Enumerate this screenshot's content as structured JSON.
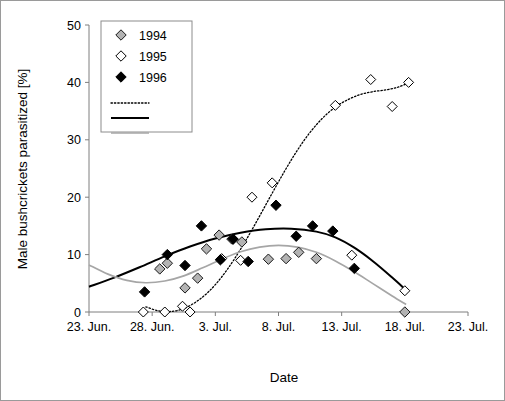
{
  "figure": {
    "frame_border_color": "#9a9a9a",
    "background": "#ffffff"
  },
  "axis": {
    "x_title": "Date",
    "y_title": "Male bushcrickets parasitized [%]"
  },
  "legend": {
    "entries": [
      {
        "label": "1994",
        "marker": "diamond-gray-filled",
        "color": "#b3b3b3"
      },
      {
        "label": "1995",
        "marker": "diamond-open-white",
        "color": "#ffffff"
      },
      {
        "label": "1996",
        "marker": "diamond-black-filled",
        "color": "#000000"
      }
    ],
    "lines": [
      {
        "name": "dotted-trend-line",
        "style": "dotted",
        "color": "#000000"
      },
      {
        "name": "solid-trend-line",
        "style": "solid",
        "color": "#000000"
      },
      {
        "name": "gray-trend-line",
        "style": "solid",
        "color": "#a6a6a6"
      }
    ]
  },
  "chart_data": {
    "type": "scatter",
    "title": "",
    "xlabel": "Date",
    "ylabel": "Male bushcrickets parasitized [%]",
    "ylim": [
      0,
      50
    ],
    "yticks": [
      0,
      10,
      20,
      30,
      40,
      50
    ],
    "xlim_days": [
      0,
      30
    ],
    "xticks_days": [
      0,
      5,
      10,
      15,
      20,
      25,
      30
    ],
    "xtick_labels": [
      "23. Jun.",
      "28. Jun.",
      "3. Jul.",
      "8. Jul.",
      "13. Jul.",
      "18. Jul.",
      "23. Jul."
    ],
    "grid": false,
    "legend_position": "top-left",
    "series": [
      {
        "name": "1994",
        "marker": "diamond-gray-filled",
        "color": "#b3b3b3",
        "points": [
          {
            "x": 5.6,
            "y": 7.5
          },
          {
            "x": 6.2,
            "y": 8.5
          },
          {
            "x": 7.6,
            "y": 4.2
          },
          {
            "x": 8.6,
            "y": 5.9
          },
          {
            "x": 9.3,
            "y": 11.0
          },
          {
            "x": 10.3,
            "y": 13.4
          },
          {
            "x": 11.4,
            "y": 12.7
          },
          {
            "x": 12.1,
            "y": 12.2
          },
          {
            "x": 14.2,
            "y": 9.2
          },
          {
            "x": 15.6,
            "y": 9.3
          },
          {
            "x": 16.6,
            "y": 10.4
          },
          {
            "x": 18.0,
            "y": 9.3
          },
          {
            "x": 25.0,
            "y": 0.0
          }
        ]
      },
      {
        "name": "1995",
        "marker": "diamond-open-white",
        "color": "#ffffff",
        "points": [
          {
            "x": 4.3,
            "y": 0.0
          },
          {
            "x": 6.0,
            "y": 0.0
          },
          {
            "x": 7.4,
            "y": 1.0
          },
          {
            "x": 8.0,
            "y": 0.0
          },
          {
            "x": 10.5,
            "y": 9.3
          },
          {
            "x": 11.3,
            "y": 12.7
          },
          {
            "x": 12.0,
            "y": 9.0
          },
          {
            "x": 12.9,
            "y": 20.0
          },
          {
            "x": 14.5,
            "y": 22.5
          },
          {
            "x": 19.5,
            "y": 36.0
          },
          {
            "x": 20.8,
            "y": 9.9
          },
          {
            "x": 22.3,
            "y": 40.5
          },
          {
            "x": 24.0,
            "y": 35.8
          },
          {
            "x": 25.3,
            "y": 40.0
          },
          {
            "x": 25.0,
            "y": 3.7
          }
        ]
      },
      {
        "name": "1996",
        "marker": "diamond-black-filled",
        "color": "#000000",
        "points": [
          {
            "x": 4.4,
            "y": 3.5
          },
          {
            "x": 6.2,
            "y": 10.0
          },
          {
            "x": 7.6,
            "y": 8.1
          },
          {
            "x": 8.9,
            "y": 15.0
          },
          {
            "x": 10.4,
            "y": 9.1
          },
          {
            "x": 11.4,
            "y": 12.7
          },
          {
            "x": 12.6,
            "y": 8.8
          },
          {
            "x": 14.8,
            "y": 18.6
          },
          {
            "x": 16.4,
            "y": 13.2
          },
          {
            "x": 17.7,
            "y": 15.0
          },
          {
            "x": 19.3,
            "y": 14.1
          },
          {
            "x": 21.0,
            "y": 7.6
          }
        ]
      }
    ],
    "trend_curves": [
      {
        "name": "1995-dotted-trend",
        "style": "dotted",
        "color": "#000000",
        "points": [
          {
            "x": 4.5,
            "y": 0.9
          },
          {
            "x": 5.5,
            "y": 0.2
          },
          {
            "x": 6.5,
            "y": 0.1
          },
          {
            "x": 7.5,
            "y": 0.6
          },
          {
            "x": 8.5,
            "y": 1.8
          },
          {
            "x": 9.5,
            "y": 3.6
          },
          {
            "x": 10.5,
            "y": 6.1
          },
          {
            "x": 11.5,
            "y": 9.2
          },
          {
            "x": 12.5,
            "y": 12.8
          },
          {
            "x": 13.5,
            "y": 16.7
          },
          {
            "x": 14.5,
            "y": 20.7
          },
          {
            "x": 15.5,
            "y": 24.6
          },
          {
            "x": 16.5,
            "y": 28.2
          },
          {
            "x": 17.5,
            "y": 31.3
          },
          {
            "x": 18.5,
            "y": 33.8
          },
          {
            "x": 19.5,
            "y": 35.7
          },
          {
            "x": 20.5,
            "y": 37.0
          },
          {
            "x": 21.5,
            "y": 37.9
          },
          {
            "x": 22.5,
            "y": 38.4
          },
          {
            "x": 23.5,
            "y": 38.7
          },
          {
            "x": 24.5,
            "y": 39.2
          },
          {
            "x": 25.4,
            "y": 40.0
          }
        ]
      },
      {
        "name": "1996-solid-trend",
        "style": "solid",
        "color": "#000000",
        "points": [
          {
            "x": 0.0,
            "y": 4.4
          },
          {
            "x": 2.0,
            "y": 6.0
          },
          {
            "x": 4.0,
            "y": 7.8
          },
          {
            "x": 6.0,
            "y": 9.7
          },
          {
            "x": 8.0,
            "y": 11.4
          },
          {
            "x": 10.0,
            "y": 12.8
          },
          {
            "x": 12.0,
            "y": 13.8
          },
          {
            "x": 14.0,
            "y": 14.4
          },
          {
            "x": 16.0,
            "y": 14.5
          },
          {
            "x": 18.0,
            "y": 14.0
          },
          {
            "x": 19.5,
            "y": 13.0
          },
          {
            "x": 21.0,
            "y": 11.2
          },
          {
            "x": 22.5,
            "y": 8.8
          },
          {
            "x": 24.0,
            "y": 6.0
          },
          {
            "x": 25.1,
            "y": 3.8
          }
        ]
      },
      {
        "name": "1994-gray-trend",
        "style": "solid",
        "color": "#a6a6a6",
        "points": [
          {
            "x": 0.0,
            "y": 8.2
          },
          {
            "x": 1.5,
            "y": 6.6
          },
          {
            "x": 3.0,
            "y": 5.5
          },
          {
            "x": 4.5,
            "y": 5.1
          },
          {
            "x": 6.0,
            "y": 5.4
          },
          {
            "x": 7.5,
            "y": 6.3
          },
          {
            "x": 9.0,
            "y": 7.7
          },
          {
            "x": 10.5,
            "y": 9.2
          },
          {
            "x": 12.0,
            "y": 10.5
          },
          {
            "x": 13.5,
            "y": 11.3
          },
          {
            "x": 15.0,
            "y": 11.6
          },
          {
            "x": 16.5,
            "y": 11.3
          },
          {
            "x": 18.0,
            "y": 10.4
          },
          {
            "x": 19.5,
            "y": 8.9
          },
          {
            "x": 21.0,
            "y": 7.0
          },
          {
            "x": 22.5,
            "y": 4.9
          },
          {
            "x": 24.0,
            "y": 2.8
          },
          {
            "x": 25.1,
            "y": 1.3
          }
        ]
      }
    ]
  }
}
